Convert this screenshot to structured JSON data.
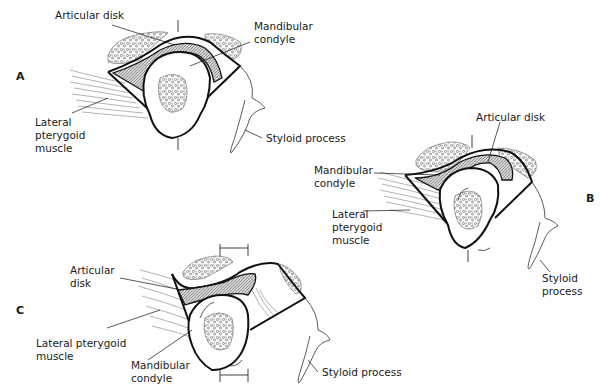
{
  "panels": [
    {
      "letter": "A",
      "labels": {
        "articular_disk": "Articular disk",
        "mandibular_condyle": "Mandibular\ncondyle",
        "lateral_pterygoid": "Lateral\npterygoid\nmuscle",
        "styloid_process": "Styloid process"
      }
    },
    {
      "letter": "B",
      "labels": {
        "articular_disk": "Articular disk",
        "mandibular_condyle": "Mandibular\ncondyle",
        "lateral_pterygoid": "Lateral\npterygoid\nmuscle",
        "styloid_process": "Styloid\nprocess"
      }
    },
    {
      "letter": "C",
      "labels": {
        "articular_disk": "Articular\ndisk",
        "mandibular_condyle": "Mandibular\ncondyle",
        "lateral_pterygoid": "Lateral  pterygoid\nmuscle",
        "styloid_process": "Styloid process"
      }
    }
  ],
  "colors": {
    "ink": "#1a1a1a",
    "disk_fill": "#9a9a9a",
    "background": "#ffffff"
  }
}
